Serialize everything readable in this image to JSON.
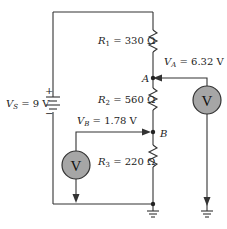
{
  "diagram": {
    "type": "voltage-divider-circuit",
    "source": {
      "symbol": "V",
      "subscript": "S",
      "value": "9 V",
      "plus": "+",
      "minus": "−"
    },
    "resistors": [
      {
        "symbol": "R",
        "subscript": "1",
        "value": "330 Ω"
      },
      {
        "symbol": "R",
        "subscript": "2",
        "value": "560 Ω"
      },
      {
        "symbol": "R",
        "subscript": "3",
        "value": "220 Ω"
      }
    ],
    "nodes": [
      {
        "name": "A",
        "voltage_symbol": "V",
        "voltage_subscript": "A",
        "voltage": "6.32 V"
      },
      {
        "name": "B",
        "voltage_symbol": "V",
        "voltage_subscript": "B",
        "voltage": "1.78 V"
      }
    ],
    "meters": [
      {
        "label": "V",
        "measures": "A"
      },
      {
        "label": "V",
        "measures": "B"
      }
    ],
    "colors": {
      "wire": "#333333",
      "meter_fill": "#a6a6a6",
      "meter_stroke": "#333333"
    }
  }
}
